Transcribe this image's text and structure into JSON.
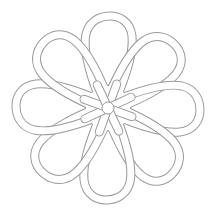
{
  "figure": {
    "petal_count": 8,
    "center": [
      108,
      108
    ],
    "line_color": "#9a9a9a",
    "fill_color": "#ffffff",
    "background": "#ffffff"
  }
}
